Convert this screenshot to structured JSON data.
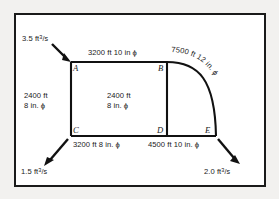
{
  "figure": {
    "type": "pipe-network-diagram",
    "background_color": "#f2f1ef",
    "panel_color": "#ffffff",
    "line_color": "#111111"
  },
  "nodes": [
    {
      "id": "A",
      "label": "A"
    },
    {
      "id": "B",
      "label": "B"
    },
    {
      "id": "C",
      "label": "C"
    },
    {
      "id": "D",
      "label": "D"
    },
    {
      "id": "E",
      "label": "E"
    }
  ],
  "pipes": [
    {
      "id": "AB",
      "from": "A",
      "to": "B",
      "length": "3200 ft",
      "diameter": "10 in",
      "label": "3200 ft 10 in ϕ"
    },
    {
      "id": "AC",
      "from": "A",
      "to": "C",
      "length": "2400 ft",
      "diameter": "8 in.",
      "label_line1": "2400 ft",
      "label_line2": "8 in. ϕ"
    },
    {
      "id": "BD",
      "from": "B",
      "to": "D",
      "length": "2400 ft",
      "diameter": "8 in.",
      "label_line1": "2400 ft",
      "label_line2": "8 in. ϕ"
    },
    {
      "id": "BE",
      "from": "B",
      "to": "E",
      "length": "7500 ft",
      "diameter": "12 in.",
      "label": "7500 ft 12 in. ϕ",
      "shape": "arc"
    },
    {
      "id": "CD",
      "from": "C",
      "to": "D",
      "length": "3200 ft",
      "diameter": "8 in.",
      "label": "3200 ft 8 in. ϕ"
    },
    {
      "id": "DE",
      "from": "D",
      "to": "E",
      "length": "4500 ft",
      "diameter": "10 in.",
      "label": "4500 ft 10 in. ϕ"
    }
  ],
  "flows": [
    {
      "id": "inflow-A",
      "node": "A",
      "direction": "in",
      "value": "3.5",
      "unit_prefix": "ft",
      "unit_exp": "3",
      "unit_den": "/s"
    },
    {
      "id": "outflow-C",
      "node": "C",
      "direction": "out",
      "value": "1.5",
      "unit_prefix": "ft",
      "unit_exp": "3",
      "unit_den": "/s"
    },
    {
      "id": "outflow-E",
      "node": "E",
      "direction": "out",
      "value": "2.0",
      "unit_prefix": "ft",
      "unit_exp": "3",
      "unit_den": "/s"
    }
  ]
}
